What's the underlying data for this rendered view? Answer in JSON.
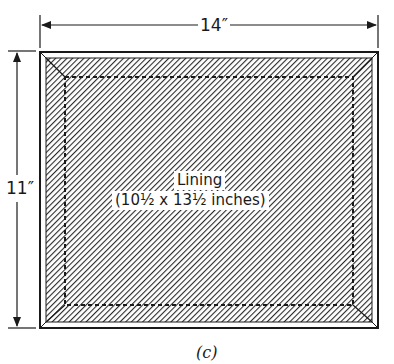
{
  "figure": {
    "caption": "(c)",
    "dimensions": {
      "width_label": "14″",
      "height_label": "11″"
    },
    "lining": {
      "title": "Lining",
      "size": "(10½ x 13½ inches)"
    },
    "colors": {
      "ink": "#1a1a1a",
      "paper": "#ffffff",
      "hatch": "#2a2a2a"
    }
  }
}
